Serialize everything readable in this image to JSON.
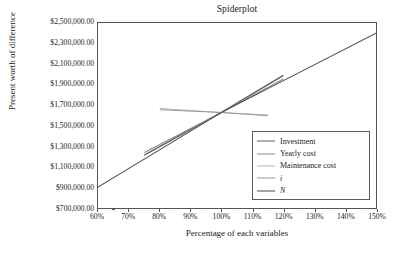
{
  "chart_data": {
    "type": "line",
    "title": "Spiderplot",
    "xlabel": "Percentage of each variables",
    "ylabel": "Present worth of difference",
    "xlim": [
      60,
      150
    ],
    "ylim": [
      700000,
      2500000
    ],
    "grid": false,
    "legend_position": "center-right",
    "x_tick_labels": [
      "60%",
      "70%",
      "80%",
      "90%",
      "100%",
      "110%",
      "120%",
      "130%",
      "140%",
      "150%"
    ],
    "x_ticks": [
      60,
      70,
      80,
      90,
      100,
      110,
      120,
      130,
      140,
      150
    ],
    "y_tick_labels": [
      "$2,500,000.00",
      "$2,300,000.00",
      "$2,100,000.00",
      "$1,900,000.00",
      "$1,700,000.00",
      "$1,500,000.00",
      "$1,300,000.00",
      "$1,100,000.00",
      "$900,000.00",
      "$700,000.00"
    ],
    "y_ticks": [
      2500000,
      2300000,
      2100000,
      1900000,
      1700000,
      1500000,
      1300000,
      1100000,
      900000,
      700000
    ],
    "series": [
      {
        "name": "Investment",
        "color": "#5f5f5f",
        "width": 1.4,
        "x": [
          75,
          100,
          120
        ],
        "values": [
          1215000,
          1630000,
          1990000
        ]
      },
      {
        "name": "Yearly cost",
        "color": "#8a8a8a",
        "width": 1.1,
        "x": [
          75,
          100,
          120
        ],
        "values": [
          1240000,
          1630000,
          1955000
        ]
      },
      {
        "name": "Maintenance cost",
        "color": "#b4b4b4",
        "width": 1.0,
        "x": [
          80,
          100,
          115
        ],
        "values": [
          1668000,
          1630000,
          1604000
        ]
      },
      {
        "name": "i",
        "color": "#9a9a9a",
        "width": 1.0,
        "x": [
          80,
          100,
          115
        ],
        "values": [
          1655000,
          1630000,
          1598000
        ]
      },
      {
        "name": "N",
        "color": "#4a4a4a",
        "width": 1.0,
        "x": [
          60,
          100,
          150
        ],
        "values": [
          903000,
          1630000,
          2402000
        ]
      }
    ]
  },
  "legend": {
    "items": [
      {
        "label": "Investment",
        "italic": false
      },
      {
        "label": "Yearly cost",
        "italic": false
      },
      {
        "label": "Maintenance cost",
        "italic": false
      },
      {
        "label": "i",
        "italic": true
      },
      {
        "label": "N",
        "italic": true
      }
    ]
  },
  "colors": {
    "axis": "#555555",
    "text": "#1b1b1b",
    "background": "#ffffff",
    "legend_border": "#5a5a5a"
  }
}
